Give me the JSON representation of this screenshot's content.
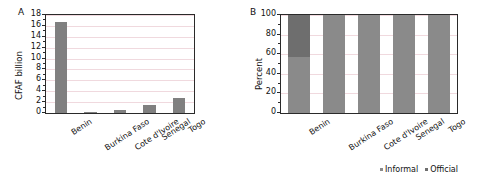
{
  "figure": {
    "panels": [
      {
        "letter": "A",
        "ylabel": "CFAF billion",
        "yticks": [
          "0",
          "2",
          "4",
          "6",
          "8",
          "10",
          "12",
          "14",
          "16",
          "18"
        ]
      },
      {
        "letter": "B",
        "ylabel": "Percent",
        "yticks": [
          "0",
          "20",
          "40",
          "60",
          "80",
          "100"
        ]
      }
    ],
    "legend": {
      "informal_label": "Informal",
      "official_label": "Official",
      "informal_color": "#8a8a8a",
      "official_color": "#6e6e6e"
    }
  },
  "chart_data": [
    {
      "type": "bar",
      "panel": "A",
      "title": "",
      "xlabel": "",
      "ylabel": "CFAF billion",
      "ylim": [
        0,
        18
      ],
      "ytick_values": [
        0,
        2,
        4,
        6,
        8,
        10,
        12,
        14,
        16,
        18
      ],
      "grid": true,
      "legend_position": "none",
      "categories": [
        "Benin",
        "Burkina Faso",
        "Cote d'Ivoire",
        "Senegal",
        "Togo"
      ],
      "values": [
        16.8,
        0.1,
        0.5,
        1.5,
        2.8
      ],
      "bar_color": "#808080"
    },
    {
      "type": "bar",
      "panel": "B",
      "title": "",
      "xlabel": "",
      "ylabel": "Percent",
      "ylim": [
        0,
        100
      ],
      "ytick_values": [
        0,
        20,
        40,
        60,
        80,
        100
      ],
      "grid": true,
      "stacked": true,
      "legend_position": "bottom-right",
      "categories": [
        "Benin",
        "Burkina Faso",
        "Cote d'Ivoire",
        "Senegal",
        "Togo"
      ],
      "series": [
        {
          "name": "Informal",
          "values": [
            57,
            100,
            100,
            100,
            100
          ],
          "color": "#8a8a8a"
        },
        {
          "name": "Official",
          "values": [
            43,
            0,
            0,
            0,
            0
          ],
          "color": "#6e6e6e"
        }
      ]
    }
  ]
}
